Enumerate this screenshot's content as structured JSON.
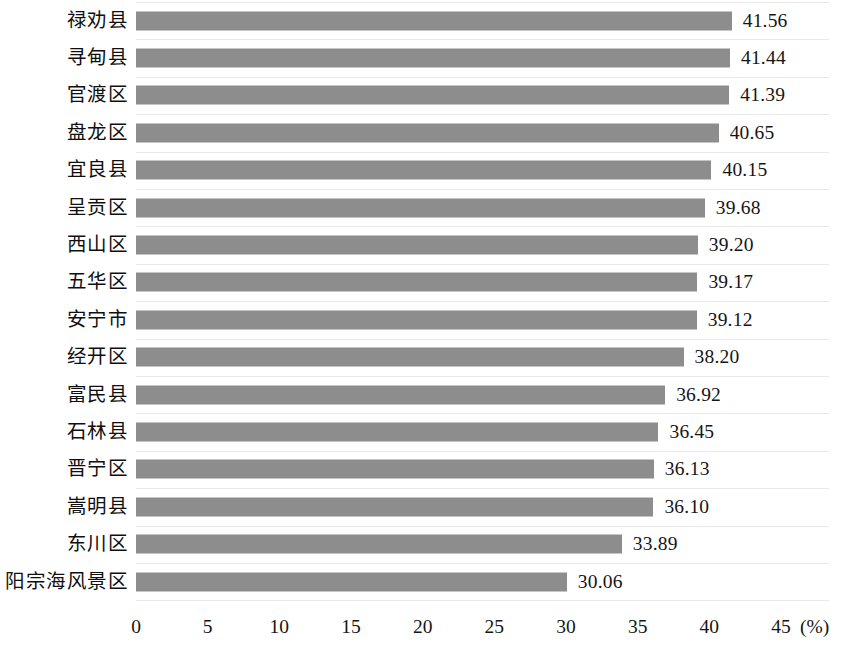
{
  "chart_data": {
    "type": "bar",
    "orientation": "horizontal",
    "title": "",
    "subtitle": "",
    "xlabel": "(%)",
    "ylabel": "",
    "unit": "(%)",
    "xlim": [
      0,
      45
    ],
    "xticks": [
      0,
      5,
      10,
      15,
      20,
      25,
      30,
      35,
      40,
      45
    ],
    "xtick_labels": [
      "0",
      "5",
      "10",
      "15",
      "20",
      "25",
      "30",
      "35",
      "40",
      "45"
    ],
    "grid": true,
    "grid_axis": "y",
    "legend": null,
    "legend_position": "none",
    "bar_color": "#8d8d8d",
    "gridline_color": "#e9e9e9",
    "categories": [
      "禄劝县",
      "寻甸县",
      "官渡区",
      "盘龙区",
      "宜良县",
      "呈贡区",
      "西山区",
      "五华区",
      "安宁市",
      "经开区",
      "富民县",
      "石林县",
      "晋宁区",
      "嵩明县",
      "东川区",
      "阳宗海风景区"
    ],
    "values": [
      41.56,
      41.44,
      41.39,
      40.65,
      40.15,
      39.68,
      39.2,
      39.17,
      39.12,
      38.2,
      36.92,
      36.45,
      36.13,
      36.1,
      33.89,
      30.06
    ],
    "value_labels": [
      "41.56",
      "41.44",
      "41.39",
      "40.65",
      "40.15",
      "39.68",
      "39.20",
      "39.17",
      "39.12",
      "38.20",
      "36.92",
      "36.45",
      "36.13",
      "36.10",
      "33.89",
      "30.06"
    ]
  }
}
